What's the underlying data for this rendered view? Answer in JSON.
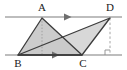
{
  "figure": {
    "kind": "geometry-diagram",
    "background_color": "#ffffff",
    "stroke_color": "#3c3c3c",
    "label_color": "#1a1a1a",
    "fill_light": "#c9c9c9",
    "fill_overlap": "#9a9a9a",
    "guide_color": "#8c8c8c",
    "width": 127,
    "height": 70
  },
  "labels": {
    "a": "A",
    "b": "B",
    "c": "C",
    "d": "D"
  },
  "points": {
    "A": {
      "x": 42,
      "y": 18,
      "label_x": 42,
      "label_y": 11
    },
    "B": {
      "x": 18,
      "y": 55,
      "label_x": 18,
      "label_y": 67
    },
    "C": {
      "x": 82,
      "y": 55,
      "label_x": 83,
      "label_y": 67
    },
    "D": {
      "x": 110,
      "y": 18,
      "label_x": 110,
      "label_y": 11
    }
  },
  "lines": {
    "top_parallel": {
      "x1": 5,
      "y1": 17,
      "x2": 122,
      "y2": 17
    },
    "bottom_parallel": {
      "x1": 5,
      "y1": 55,
      "x2": 122,
      "y2": 55
    },
    "top_arrow_x": 70,
    "bottom_arrow_x": 58
  },
  "markers": {
    "parallel_arrow": "arrow-marker",
    "right_angle": "right-angle-marker",
    "right_angle_x": 110,
    "right_angle_y": 55,
    "right_angle_size": 5
  },
  "guides": {
    "altitude_from_a": {
      "x": 42,
      "y1": 18,
      "y2": 55,
      "style": "dotted"
    },
    "altitude_from_d": {
      "x": 110,
      "y1": 18,
      "y2": 55,
      "style": "dashed"
    }
  },
  "shapes": {
    "triangle_abc": "42,18 18,55 82,55",
    "triangle_bcd": "110,18 18,55 82,55",
    "overlap_region": "82,55 18,55 62,36"
  }
}
